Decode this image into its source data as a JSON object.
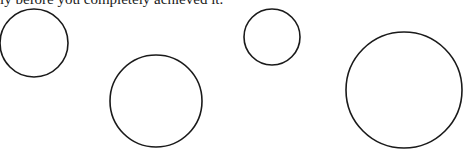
{
  "caption": {
    "text": "ly before you completely achieved it."
  },
  "diagram": {
    "width": 464,
    "height": 156,
    "stroke_color": "#1a1a1a",
    "fill_color": "#ffffff",
    "circles": [
      {
        "id": "circle-1",
        "cx": 34,
        "cy": 43,
        "r": 34
      },
      {
        "id": "circle-2",
        "cx": 156,
        "cy": 101,
        "r": 46
      },
      {
        "id": "circle-3",
        "cx": 272,
        "cy": 37,
        "r": 28
      },
      {
        "id": "circle-4",
        "cx": 404,
        "cy": 90,
        "r": 58
      }
    ]
  }
}
